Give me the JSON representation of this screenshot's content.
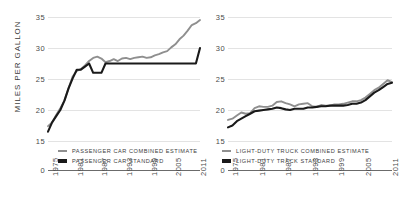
{
  "axis": {
    "ylabel": "MILES PER GALLON",
    "yticks": [
      35,
      30,
      25,
      20,
      15,
      0
    ],
    "xticks": [
      "1975",
      "1981",
      "1987",
      "1993",
      "1999",
      "2005",
      "2011"
    ]
  },
  "colors": {
    "estimate": "#8f8f8f",
    "standard": "#1a1a1a",
    "grid": "#e3e3e3",
    "axis": "#6b6b6b",
    "text": "#4a4a4a"
  },
  "legend": {
    "left": [
      {
        "key": "estimate",
        "label": "PASSENGER CAR COMBINED ESTIMATE"
      },
      {
        "key": "standard",
        "label": "PASSENGER CAR STANDARD"
      }
    ],
    "right": [
      {
        "key": "estimate",
        "label": "LIGHT-DUTY TRUCK COMBINED ESTIMATE"
      },
      {
        "key": "standard",
        "label": "LIGHT-DUTY TRACK STANDARD"
      }
    ]
  },
  "chart_data": [
    {
      "type": "line",
      "title": "",
      "panel": "left",
      "xlabel": "",
      "ylabel": "MILES PER GALLON",
      "ylim": [
        0,
        36
      ],
      "xlim": [
        1975,
        2012
      ],
      "grid": true,
      "legend_position": "below-plot",
      "x": [
        1975,
        1976,
        1977,
        1978,
        1979,
        1980,
        1981,
        1982,
        1983,
        1984,
        1985,
        1986,
        1987,
        1988,
        1989,
        1990,
        1991,
        1992,
        1993,
        1994,
        1995,
        1996,
        1997,
        1998,
        1999,
        2000,
        2001,
        2002,
        2003,
        2004,
        2005,
        2006,
        2007,
        2008,
        2009,
        2010,
        2011,
        2012
      ],
      "series": [
        {
          "name": "PASSENGER CAR COMBINED ESTIMATE",
          "color": "#8f8f8f",
          "values": [
            17.4,
            18.0,
            19.2,
            20.3,
            21.5,
            23.5,
            25.4,
            26.3,
            26.6,
            27.2,
            27.9,
            28.4,
            28.6,
            28.3,
            27.7,
            27.9,
            28.2,
            27.9,
            28.3,
            28.4,
            28.2,
            28.4,
            28.5,
            28.6,
            28.4,
            28.5,
            28.8,
            29.0,
            29.3,
            29.5,
            30.1,
            30.6,
            31.4,
            32.0,
            32.8,
            33.7,
            34.0,
            34.5
          ]
        },
        {
          "name": "PASSENGER CAR STANDARD",
          "color": "#1a1a1a",
          "values": [
            16.5,
            18.0,
            19.0,
            20.0,
            21.5,
            23.5,
            25.1,
            26.5,
            26.5,
            27.0,
            27.5,
            26.0,
            26.0,
            26.0,
            27.5,
            27.5,
            27.5,
            27.5,
            27.5,
            27.5,
            27.5,
            27.5,
            27.5,
            27.5,
            27.5,
            27.5,
            27.5,
            27.5,
            27.5,
            27.5,
            27.5,
            27.5,
            27.5,
            27.5,
            27.5,
            27.5,
            27.5,
            30.0
          ]
        }
      ]
    },
    {
      "type": "line",
      "title": "",
      "panel": "right",
      "xlabel": "",
      "ylabel": "MILES PER GALLON",
      "ylim": [
        0,
        36
      ],
      "xlim": [
        1975,
        2012
      ],
      "grid": true,
      "legend_position": "below-plot",
      "x": [
        1975,
        1976,
        1977,
        1978,
        1979,
        1980,
        1981,
        1982,
        1983,
        1984,
        1985,
        1986,
        1987,
        1988,
        1989,
        1990,
        1991,
        1992,
        1993,
        1994,
        1995,
        1996,
        1997,
        1998,
        1999,
        2000,
        2001,
        2002,
        2003,
        2004,
        2005,
        2006,
        2007,
        2008,
        2009,
        2010,
        2011,
        2012
      ],
      "series": [
        {
          "name": "LIGHT-DUTY TRUCK COMBINED ESTIMATE",
          "color": "#8f8f8f",
          "values": [
            18.4,
            18.6,
            19.1,
            19.6,
            19.4,
            19.5,
            20.3,
            20.6,
            20.5,
            20.5,
            20.7,
            21.3,
            21.4,
            21.1,
            20.9,
            20.6,
            20.9,
            21.0,
            21.1,
            20.6,
            20.5,
            20.8,
            20.7,
            20.7,
            20.9,
            20.9,
            21.0,
            21.2,
            21.4,
            21.4,
            21.6,
            22.0,
            22.6,
            23.2,
            23.6,
            24.2,
            24.8,
            24.5
          ]
        },
        {
          "name": "LIGHT-DUTY TRACK STANDARD",
          "color": "#1a1a1a",
          "values": [
            17.2,
            17.5,
            18.2,
            18.6,
            19.0,
            19.4,
            19.8,
            19.9,
            20.0,
            20.1,
            20.2,
            20.4,
            20.3,
            20.1,
            20.0,
            20.2,
            20.2,
            20.2,
            20.4,
            20.4,
            20.5,
            20.6,
            20.6,
            20.7,
            20.7,
            20.7,
            20.7,
            20.8,
            21.0,
            21.0,
            21.2,
            21.6,
            22.2,
            22.8,
            23.2,
            23.7,
            24.2,
            24.4
          ]
        }
      ]
    }
  ]
}
